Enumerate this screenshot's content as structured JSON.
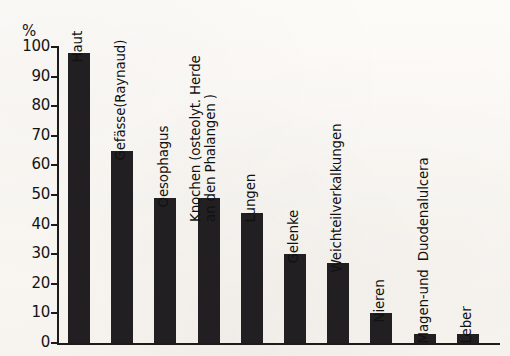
{
  "chart_data": {
    "type": "bar",
    "title": "",
    "subtitle": "",
    "xlabel": "",
    "ylabel": "%",
    "ylim": [
      0,
      100
    ],
    "grid": false,
    "legend": "none",
    "orientation": "vertical",
    "bar_color": "#211f21",
    "axis_color": "#1b1b1b",
    "background_color": "#fbf9f5",
    "tick_labels": [
      "100",
      "90",
      "80",
      "70",
      "60",
      "50",
      "40",
      "30",
      "20",
      "10",
      "0"
    ],
    "tick_values": [
      100,
      90,
      80,
      70,
      60,
      50,
      40,
      30,
      20,
      10,
      0
    ],
    "categories": [
      "Haut",
      "Gefässe (Raynaud)",
      "Oesophagus",
      "Knochen (osteolyt. Herde an den Phalangen )",
      "Lungen",
      "Gelenke",
      "Weichteilverkalkungen",
      "Nieren",
      "Magen- und  Duodenalulcera",
      "Leber"
    ],
    "values": [
      98,
      65,
      49,
      49,
      44,
      30,
      27,
      10,
      3,
      3
    ]
  },
  "bars": [
    {
      "label": "Haut",
      "label_lines": [
        "Haut"
      ],
      "value": 98
    },
    {
      "label": "Gefässe (Raynaud)",
      "label_lines": [
        "Gefässe(Raynaud)"
      ],
      "value": 65
    },
    {
      "label": "Oesophagus",
      "label_lines": [
        "Oesophagus"
      ],
      "value": 49
    },
    {
      "label": "Knochen (osteolyt. Herde an den Phalangen )",
      "label_lines": [
        "Knochen (osteolyt. Herde",
        "an den Phalangen )"
      ],
      "value": 49
    },
    {
      "label": "Lungen",
      "label_lines": [
        "Lungen"
      ],
      "value": 44
    },
    {
      "label": "Gelenke",
      "label_lines": [
        "Gelenke"
      ],
      "value": 30
    },
    {
      "label": "Weichteilverkalkungen",
      "label_lines": [
        "Weichteilverkalkungen"
      ],
      "value": 27
    },
    {
      "label": "Nieren",
      "label_lines": [
        "Nieren"
      ],
      "value": 10
    },
    {
      "label": "Magen- und Duodenalulcera",
      "label_lines": [
        "Magen-und  Duodenalulcera"
      ],
      "value": 3
    },
    {
      "label": "Leber",
      "label_lines": [
        "Leber"
      ],
      "value": 3
    }
  ],
  "axis": {
    "unit": "%",
    "ticks": [
      "100",
      "90",
      "80",
      "70",
      "60",
      "50",
      "40",
      "30",
      "20",
      "10",
      "0"
    ]
  }
}
